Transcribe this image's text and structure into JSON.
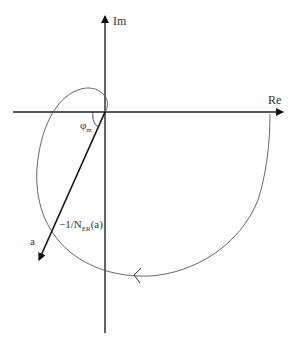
{
  "diagram": {
    "type": "nyquist-describing-function",
    "axes": {
      "real_label": "Re",
      "imag_label": "Im"
    },
    "labels": {
      "phase_margin": "φ",
      "phase_margin_sub": "m",
      "describing_function_prefix": "−1/N",
      "describing_function_sub": "ER",
      "describing_function_suffix": "(a)",
      "amplitude": "a"
    },
    "colors": {
      "axis": "#222222",
      "curve": "#555555",
      "text": "#333333",
      "background": "#ffffff"
    }
  }
}
